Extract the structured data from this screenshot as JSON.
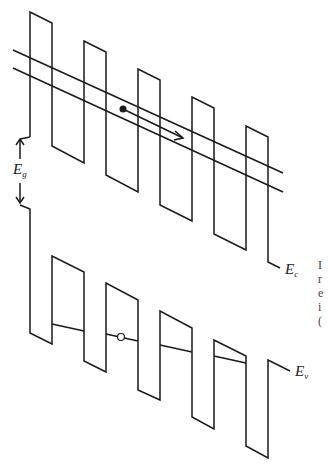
{
  "diagram": {
    "type": "band-diagram",
    "colors": {
      "line": "#1a1a1a",
      "background": "#ffffff"
    },
    "labels": {
      "band_gap": {
        "main": "E",
        "sub": "g"
      },
      "conduction_band": {
        "main": "E",
        "sub": "c"
      },
      "valence_band": {
        "main": "E",
        "sub": "v"
      }
    },
    "side_text_fragments": [
      "I",
      "r",
      "e",
      "i",
      "("
    ],
    "conduction_band_path": [
      [
        30,
        137
      ],
      [
        30,
        12
      ],
      [
        52,
        23
      ],
      [
        52,
        146
      ],
      [
        84,
        163
      ],
      [
        84,
        41
      ],
      [
        106,
        52
      ],
      [
        106,
        175
      ],
      [
        138,
        192
      ],
      [
        138,
        69
      ],
      [
        160,
        80
      ],
      [
        160,
        205
      ],
      [
        192,
        221
      ],
      [
        192,
        97
      ],
      [
        214,
        108
      ],
      [
        214,
        234
      ],
      [
        246,
        250
      ],
      [
        246,
        126
      ],
      [
        268,
        137
      ],
      [
        268,
        262
      ],
      [
        280,
        268
      ]
    ],
    "valence_band_path": [
      [
        20,
        205
      ],
      [
        30,
        209
      ],
      [
        30,
        333
      ],
      [
        52,
        344
      ],
      [
        52,
        256
      ],
      [
        84,
        272
      ],
      [
        84,
        361
      ],
      [
        106,
        372
      ],
      [
        106,
        283
      ],
      [
        138,
        300
      ],
      [
        138,
        390
      ],
      [
        160,
        400
      ],
      [
        160,
        311
      ],
      [
        192,
        328
      ],
      [
        192,
        417
      ],
      [
        214,
        429
      ],
      [
        214,
        340
      ],
      [
        246,
        356
      ],
      [
        246,
        446
      ],
      [
        268,
        458
      ],
      [
        268,
        360
      ],
      [
        290,
        371
      ]
    ],
    "minibands_conduction": [
      {
        "from": [
          13,
          50
        ],
        "to": [
          283,
          173
        ]
      },
      {
        "from": [
          13,
          68
        ],
        "to": [
          283,
          192
        ]
      }
    ],
    "minibands_valence": [
      {
        "from": [
          52,
          324
        ],
        "to": [
          84,
          331
        ]
      },
      {
        "from": [
          106,
          334
        ],
        "to": [
          138,
          341
        ]
      },
      {
        "from": [
          160,
          345
        ],
        "to": [
          192,
          352
        ]
      },
      {
        "from": [
          214,
          356
        ],
        "to": [
          246,
          363
        ]
      }
    ],
    "electron": {
      "x": 123,
      "y": 109,
      "arrow_to": [
        183,
        138
      ]
    },
    "hole": {
      "x": 121,
      "y": 337
    },
    "gap_arrow": {
      "x": 20,
      "top": 137,
      "bottom": 205
    }
  }
}
